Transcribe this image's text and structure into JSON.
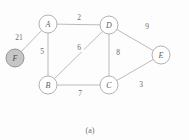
{
  "figure": {
    "caption": "(a)",
    "background_color": "#fdfdfd",
    "edge_color": "#b3b3b3",
    "node_stroke_color": "#a8a8a8",
    "highlight_fill_color": "#c6c6c6",
    "label_color": "#5e5e5e"
  },
  "chart_data": {
    "type": "diagram",
    "subtype": "weighted-undirected-graph",
    "title": "",
    "caption": "(a)",
    "nodes": [
      {
        "id": "A",
        "label": "A",
        "x": 48,
        "y": 24,
        "r": 9,
        "highlighted": false
      },
      {
        "id": "B",
        "label": "B",
        "x": 48,
        "y": 85,
        "r": 9,
        "highlighted": false
      },
      {
        "id": "C",
        "label": "C",
        "x": 109,
        "y": 85,
        "r": 9,
        "highlighted": false
      },
      {
        "id": "D",
        "label": "D",
        "x": 109,
        "y": 25,
        "r": 9,
        "highlighted": false
      },
      {
        "id": "E",
        "label": "E",
        "x": 161,
        "y": 55,
        "r": 9,
        "highlighted": false
      },
      {
        "id": "F",
        "label": "F",
        "x": 15,
        "y": 58,
        "r": 9,
        "highlighted": true
      }
    ],
    "edges": [
      {
        "source": "F",
        "target": "A",
        "weight": 21,
        "label_x": 19,
        "label_y": 37
      },
      {
        "source": "A",
        "target": "D",
        "weight": 2,
        "label_x": 79,
        "label_y": 17
      },
      {
        "source": "A",
        "target": "B",
        "weight": 5,
        "label_x": 42,
        "label_y": 51
      },
      {
        "source": "B",
        "target": "D",
        "weight": 6,
        "label_x": 79,
        "label_y": 47
      },
      {
        "source": "D",
        "target": "C",
        "weight": 8,
        "label_x": 118,
        "label_y": 52
      },
      {
        "source": "B",
        "target": "C",
        "weight": 7,
        "label_x": 80,
        "label_y": 93
      },
      {
        "source": "D",
        "target": "E",
        "weight": 9,
        "label_x": 147,
        "label_y": 26
      },
      {
        "source": "C",
        "target": "E",
        "weight": 3,
        "label_x": 141,
        "label_y": 84
      }
    ],
    "node_count": 6,
    "edge_count": 8,
    "directed": false,
    "weighted": true
  }
}
